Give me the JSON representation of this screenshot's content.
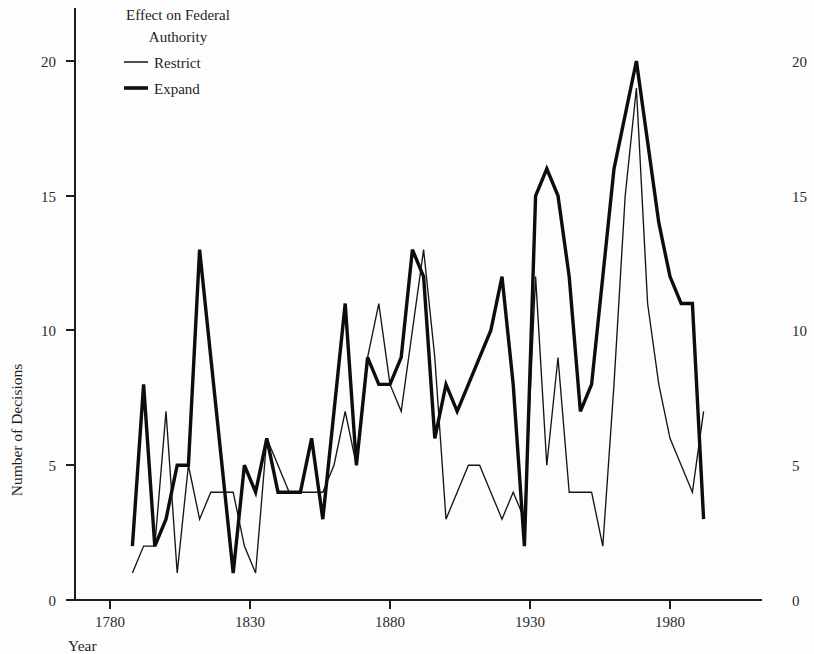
{
  "figure": {
    "background_color": "#fdfdfd",
    "ink_color": "#151515"
  },
  "axes": {
    "x_title": "Year",
    "y_title": "Number of Decisions",
    "x_ticks": [
      "1780",
      "1830",
      "1880",
      "1930",
      "1980"
    ],
    "y_ticks_left": [
      "0",
      "5",
      "10",
      "15",
      "20"
    ],
    "y_ticks_right": [
      "0",
      "5",
      "10",
      "15",
      "20"
    ]
  },
  "legend": {
    "title_line_1": "Effect on Federal",
    "title_line_2": "Authority",
    "entries": [
      {
        "label": "Restrict",
        "style": "thin"
      },
      {
        "label": "Expand",
        "style": "thick"
      }
    ]
  },
  "chart_data": {
    "type": "line",
    "title": "",
    "xlabel": "Year",
    "ylabel": "Number of Decisions",
    "xlim": [
      1785,
      1995
    ],
    "ylim": [
      0,
      21
    ],
    "grid": false,
    "legend_position": "top-left-inside",
    "legend_title": "Effect on Federal Authority",
    "x": [
      1788,
      1792,
      1796,
      1800,
      1804,
      1808,
      1812,
      1816,
      1820,
      1824,
      1828,
      1832,
      1836,
      1840,
      1844,
      1848,
      1852,
      1856,
      1860,
      1864,
      1868,
      1872,
      1876,
      1880,
      1884,
      1888,
      1892,
      1896,
      1900,
      1904,
      1908,
      1912,
      1916,
      1920,
      1924,
      1928,
      1932,
      1936,
      1940,
      1944,
      1948,
      1952,
      1956,
      1960,
      1964,
      1968,
      1972,
      1976,
      1980,
      1984,
      1988,
      1992
    ],
    "series": [
      {
        "name": "Restrict",
        "style": "thin",
        "values": [
          1,
          2,
          2,
          7,
          1,
          5,
          3,
          4,
          4,
          4,
          2,
          1,
          6,
          5,
          4,
          4,
          4,
          4,
          5,
          7,
          5,
          9,
          11,
          8,
          7,
          10,
          13,
          9,
          3,
          4,
          5,
          5,
          4,
          3,
          4,
          3,
          12,
          5,
          9,
          4,
          4,
          4,
          2,
          8,
          15,
          19,
          11,
          8,
          6,
          5,
          4,
          7
        ]
      },
      {
        "name": "Expand",
        "style": "thick",
        "values": [
          2,
          8,
          2,
          3,
          5,
          5,
          13,
          9,
          5,
          1,
          5,
          4,
          6,
          4,
          4,
          4,
          6,
          3,
          7,
          11,
          5,
          9,
          8,
          8,
          9,
          13,
          12,
          6,
          8,
          7,
          8,
          9,
          10,
          12,
          8,
          2,
          15,
          16,
          15,
          12,
          7,
          8,
          12,
          16,
          18,
          20,
          17,
          14,
          12,
          11,
          11,
          3
        ]
      }
    ]
  }
}
